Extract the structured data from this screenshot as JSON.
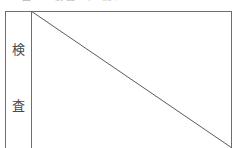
{
  "figure": {
    "clipped_caption": "図  1  検査  の  流れ",
    "row_label": {
      "characters": [
        "検",
        "査"
      ],
      "reading": "検査",
      "orientation": "vertical"
    },
    "colors": {
      "background": "#ffffff",
      "frame_line": "#6e6e6e",
      "divider_line": "#6e6e6e",
      "diagonal_line": "#5a5a5a",
      "text": "#4a4a4a",
      "clipped_text": "#b9b9b9"
    },
    "diagonal": {
      "start_x": 0,
      "start_y": 0,
      "end_x": 201,
      "end_y": 137,
      "stroke_width": 1
    }
  }
}
